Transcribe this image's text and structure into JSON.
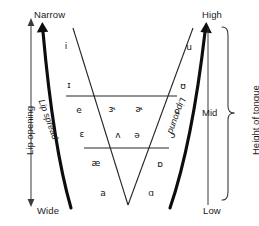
{
  "diagram": {
    "type": "ipa-vowel-chart",
    "corner_labels": {
      "top_left": "Narrow",
      "bottom_left": "Wide",
      "top_right": "High",
      "bottom_right": "Low",
      "mid_right": "Mid"
    },
    "axis_labels": {
      "left": "Lip opening",
      "right": "Height of tongue"
    },
    "curve_labels": {
      "left_curve": "Lip spread",
      "right_curve": "Lip round"
    },
    "colors": {
      "ink": "#1a1a1a",
      "thick_curve": "#000000",
      "thin_line": "#333333",
      "background": "#ffffff"
    },
    "vowels": [
      {
        "symbol": "i",
        "name": "close-front-unrounded",
        "x": 66,
        "y": 46
      },
      {
        "symbol": "u",
        "name": "close-back-rounded",
        "x": 189,
        "y": 47
      },
      {
        "symbol": "ɪ",
        "name": "near-close-front-unrounded",
        "x": 69,
        "y": 85
      },
      {
        "symbol": "ʊ",
        "name": "near-close-back-rounded",
        "x": 183,
        "y": 86
      },
      {
        "symbol": "e",
        "name": "close-mid-front-unrounded",
        "x": 79,
        "y": 110
      },
      {
        "symbol": "ɝ",
        "name": "mid-central-rhotic-stressed",
        "x": 112,
        "y": 109
      },
      {
        "symbol": "ɚ",
        "name": "mid-central-rhotic",
        "x": 139,
        "y": 109
      },
      {
        "symbol": "o",
        "name": "close-mid-back-rounded",
        "x": 177,
        "y": 111
      },
      {
        "symbol": "ɛ",
        "name": "open-mid-front-unrounded",
        "x": 82,
        "y": 134
      },
      {
        "symbol": "ʌ",
        "name": "open-mid-back-unrounded",
        "x": 118,
        "y": 135
      },
      {
        "symbol": "ə",
        "name": "mid-central-schwa",
        "x": 137,
        "y": 135
      },
      {
        "symbol": "ɔ",
        "name": "open-mid-back-rounded",
        "x": 173,
        "y": 135
      },
      {
        "symbol": "æ",
        "name": "near-open-front-unrounded",
        "x": 96,
        "y": 163
      },
      {
        "symbol": "ɒ",
        "name": "open-back-rounded",
        "x": 160,
        "y": 164
      },
      {
        "symbol": "a",
        "name": "open-front-unrounded",
        "x": 103,
        "y": 193
      },
      {
        "symbol": "ɑ",
        "name": "open-back-unrounded",
        "x": 151,
        "y": 193
      }
    ]
  }
}
